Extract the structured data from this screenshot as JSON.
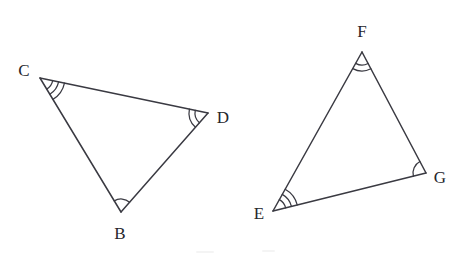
{
  "figure": {
    "background_color": "#ffffff",
    "stroke_color": "#3a3a42",
    "label_color": "#26262c",
    "width": 465,
    "height": 262
  },
  "triangles": [
    {
      "name": "triangle-cdb",
      "vertices": [
        {
          "label": "C",
          "x": 40,
          "y": 78,
          "label_x": 24,
          "label_y": 70,
          "arc_count": 3
        },
        {
          "label": "D",
          "x": 208,
          "y": 113,
          "label_x": 223,
          "label_y": 117,
          "arc_count": 2
        },
        {
          "label": "B",
          "x": 121,
          "y": 212,
          "label_x": 120,
          "label_y": 233,
          "arc_count": 1
        }
      ],
      "edges": [
        {
          "name": "edge-cd",
          "from": "C",
          "to": "D"
        },
        {
          "name": "edge-db",
          "from": "D",
          "to": "B"
        },
        {
          "name": "edge-bc",
          "from": "B",
          "to": "C"
        }
      ]
    },
    {
      "name": "triangle-feg",
      "vertices": [
        {
          "label": "F",
          "x": 362,
          "y": 52,
          "label_x": 362,
          "label_y": 31,
          "arc_count": 2
        },
        {
          "label": "G",
          "x": 426,
          "y": 173,
          "label_x": 440,
          "label_y": 177,
          "arc_count": 1
        },
        {
          "label": "E",
          "x": 273,
          "y": 211,
          "label_x": 259,
          "label_y": 213,
          "arc_count": 3
        }
      ],
      "edges": [
        {
          "name": "edge-fg",
          "from": "F",
          "to": "G"
        },
        {
          "name": "edge-ge",
          "from": "G",
          "to": "E"
        },
        {
          "name": "edge-ef",
          "from": "E",
          "to": "F"
        }
      ]
    }
  ],
  "angle_marks": {
    "legend": "Arc count encodes congruent angle pairs",
    "pairs": [
      {
        "arcs": 3,
        "angles": [
          "C",
          "E"
        ]
      },
      {
        "arcs": 2,
        "angles": [
          "D",
          "F"
        ]
      },
      {
        "arcs": 1,
        "angles": [
          "B",
          "G"
        ]
      }
    ],
    "base_radius": 13,
    "radius_step": 6
  },
  "artifacts": [
    {
      "name": "speck-left",
      "x": 196,
      "y": 251,
      "width": 18
    },
    {
      "name": "speck-right",
      "x": 262,
      "y": 250,
      "width": 13
    }
  ]
}
